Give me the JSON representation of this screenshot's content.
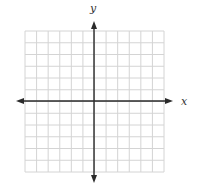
{
  "diagram": {
    "type": "coordinate-grid",
    "grid": {
      "columns": 12,
      "rows": 12,
      "line_color": "#d4d4d4"
    },
    "axes": {
      "x_label": "x",
      "y_label": "y",
      "color": "#2a2a2a",
      "arrows": [
        "left",
        "right",
        "up",
        "down"
      ]
    }
  }
}
